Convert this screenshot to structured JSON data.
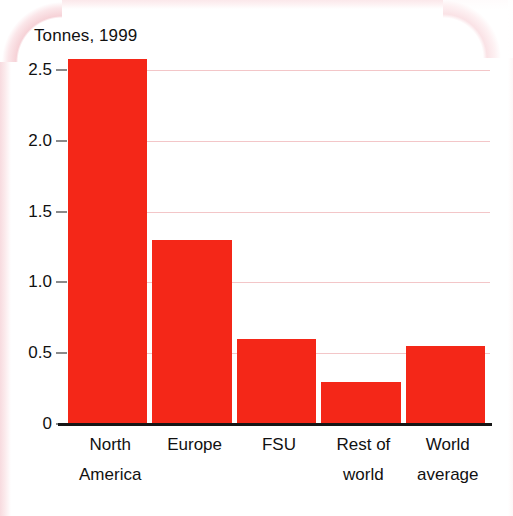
{
  "chart_data": {
    "type": "bar",
    "title": "Tonnes, 1999",
    "subtitle": "",
    "xlabel": "",
    "ylabel": "Tonnes, 1999",
    "categories": [
      "North America",
      "Europe",
      "FSU",
      "Rest of world",
      "World average"
    ],
    "category_lines": [
      {
        "line1": "North",
        "line2": "America"
      },
      {
        "line1": "Europe",
        "line2": ""
      },
      {
        "line1": "FSU",
        "line2": ""
      },
      {
        "line1": "Rest of",
        "line2": "world"
      },
      {
        "line1": "World",
        "line2": "average"
      }
    ],
    "values": [
      2.58,
      1.3,
      0.6,
      0.3,
      0.55
    ],
    "ylim": [
      0,
      2.6
    ],
    "yticks": [
      0,
      0.5,
      1.0,
      1.5,
      2.0,
      2.5
    ],
    "ytick_labels": [
      "0",
      "0.5",
      "1.0",
      "1.5",
      "2.0",
      "2.5"
    ],
    "grid": true,
    "legend": "none",
    "bar_color": "#f42718",
    "gridline_color": "#f3c6c8",
    "axis_color": "#161616",
    "text_color": "#111111"
  }
}
